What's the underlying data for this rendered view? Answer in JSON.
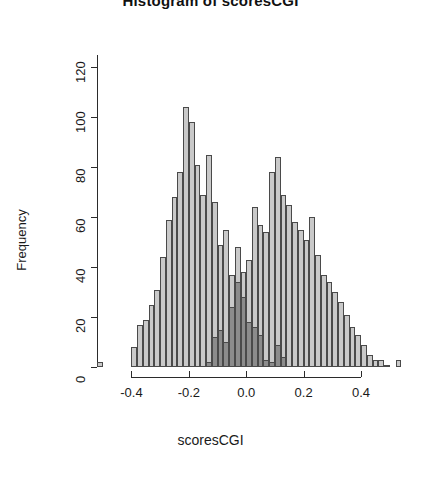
{
  "chart": {
    "title": "Histogram of scoresCGI",
    "xlabel": "scoresCGI",
    "ylabel": "Frequency"
  },
  "chart_data": {
    "type": "bar",
    "subtype": "histogram-overlay",
    "title": "Histogram of scoresCGI",
    "xlabel": "scoresCGI",
    "ylabel": "Frequency",
    "xlim": [
      -0.52,
      0.56
    ],
    "ylim": [
      0,
      125
    ],
    "grid": false,
    "legend": null,
    "xticks": [
      -0.4,
      -0.2,
      0.0,
      0.2,
      0.4
    ],
    "xtick_labels": [
      "-0.4",
      "-0.2",
      "0.0",
      "0.2",
      "0.4"
    ],
    "yticks": [
      0,
      20,
      40,
      60,
      80,
      100,
      120
    ],
    "ytick_labels": [
      "0",
      "20",
      "40",
      "60",
      "80",
      "100",
      "120"
    ],
    "bin_width": 0.02,
    "colors": {
      "background": "#c9c9c9",
      "overlay": "#8c8c8c",
      "border": "#4a4a4a",
      "axis": "#2b2b2b"
    },
    "series": [
      {
        "name": "background",
        "color": "#c9c9c9",
        "bin_starts": [
          -0.52,
          -0.5,
          -0.48,
          -0.46,
          -0.44,
          -0.42,
          -0.4,
          -0.38,
          -0.36,
          -0.34,
          -0.32,
          -0.3,
          -0.28,
          -0.26,
          -0.24,
          -0.22,
          -0.2,
          -0.18,
          -0.16,
          -0.14,
          -0.12,
          -0.1,
          -0.08,
          -0.06,
          -0.04,
          -0.02,
          0.0,
          0.02,
          0.04,
          0.06,
          0.08,
          0.1,
          0.12,
          0.14,
          0.16,
          0.18,
          0.2,
          0.22,
          0.24,
          0.26,
          0.28,
          0.3,
          0.32,
          0.34,
          0.36,
          0.38,
          0.4,
          0.42,
          0.44,
          0.46,
          0.48,
          0.5,
          0.52
        ],
        "values": [
          2,
          0,
          0,
          0,
          0,
          0,
          8,
          17,
          19,
          25,
          31,
          44,
          59,
          68,
          78,
          104,
          98,
          81,
          69,
          85,
          66,
          49,
          55,
          37,
          48,
          38,
          43,
          64,
          57,
          54,
          78,
          84,
          69,
          65,
          58,
          55,
          51,
          60,
          45,
          37,
          34,
          30,
          26,
          21,
          16,
          13,
          9,
          5,
          3,
          3,
          1,
          0,
          3
        ]
      },
      {
        "name": "overlay",
        "color": "#8c8c8c",
        "bin_starts": [
          -0.14,
          -0.12,
          -0.1,
          -0.08,
          -0.06,
          -0.04,
          -0.02,
          0.0,
          0.02,
          0.04,
          0.06,
          0.08,
          0.1,
          0.12
        ],
        "values": [
          2,
          12,
          15,
          10,
          24,
          34,
          28,
          18,
          16,
          13,
          3,
          2,
          9,
          4
        ]
      }
    ],
    "peaks": [
      {
        "x": -0.21,
        "y": 104,
        "series": "background"
      },
      {
        "x": 0.11,
        "y": 84,
        "series": "background"
      },
      {
        "x": -0.03,
        "y": 34,
        "series": "overlay"
      }
    ]
  }
}
